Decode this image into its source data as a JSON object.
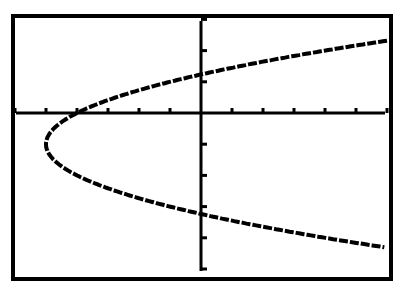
{
  "chart_data": {
    "type": "line",
    "title": "",
    "xlabel": "",
    "ylabel": "",
    "equation": "x = (y + 1)^2 - 5",
    "xlim": [
      -6,
      6
    ],
    "ylim": [
      -5,
      3
    ],
    "x_tick_step": 1,
    "y_tick_step": 1,
    "grid": false,
    "series": [
      {
        "name": "parabola",
        "x": [
          6,
          3,
          0,
          -2,
          -4,
          -5,
          -4,
          -2,
          0,
          3,
          6
        ],
        "y": [
          2.32,
          1.83,
          1.24,
          0.73,
          0,
          -1,
          -2,
          -2.73,
          -3.24,
          -3.83,
          -4.32
        ]
      }
    ]
  },
  "colors": {
    "background": "#ffffff",
    "ink": "#000000"
  }
}
